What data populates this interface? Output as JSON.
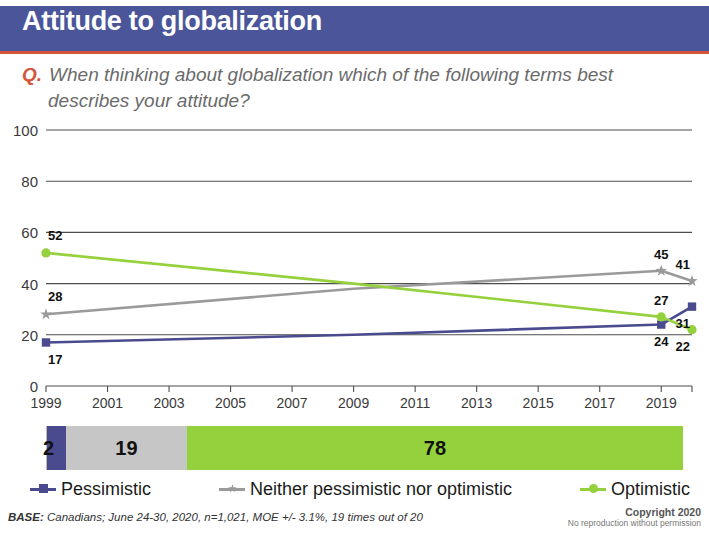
{
  "header": {
    "title": "Attitude to globalization",
    "bar_color": "#4a5699",
    "rule_color": "#d4553b"
  },
  "question": {
    "prefix": "Q.",
    "text": "When thinking about globalization which of the following terms best describes your attitude?"
  },
  "chart_data": {
    "type": "line",
    "title": "Attitude to globalization",
    "xlabel": "",
    "ylabel": "",
    "ylim": [
      0,
      100
    ],
    "yticks": [
      0,
      20,
      40,
      60,
      80,
      100
    ],
    "xlim": [
      1999,
      2020
    ],
    "xticks": [
      1999,
      2001,
      2003,
      2005,
      2007,
      2009,
      2011,
      2013,
      2015,
      2017,
      2019
    ],
    "xtick_labels": [
      "1999",
      "2001",
      "2003",
      "2005",
      "2007",
      "2009",
      "2011",
      "2013",
      "2015",
      "2017",
      "2019"
    ],
    "grid": "horizontal",
    "legend_position": "bottom",
    "series": [
      {
        "name": "Pessimistic",
        "color": "#4a4a8f",
        "marker": "square",
        "x": [
          1999,
          2009,
          2019,
          2020
        ],
        "values": [
          17,
          20,
          24,
          31
        ],
        "labels": [
          {
            "x": 1999,
            "value": 17,
            "text": "17",
            "pos": "below"
          },
          {
            "x": 2019,
            "value": 24,
            "text": "24",
            "pos": "below"
          },
          {
            "x": 2020,
            "value": 31,
            "text": "31",
            "pos": "below"
          }
        ]
      },
      {
        "name": "Neither pessimistic nor optimistic",
        "color": "#9a9a9a",
        "marker": "star",
        "x": [
          1999,
          2009,
          2019,
          2020
        ],
        "values": [
          28,
          38,
          45,
          41
        ],
        "labels": [
          {
            "x": 1999,
            "value": 28,
            "text": "28",
            "pos": "above"
          },
          {
            "x": 2019,
            "value": 45,
            "text": "45",
            "pos": "above"
          },
          {
            "x": 2020,
            "value": 41,
            "text": "41",
            "pos": "above"
          }
        ]
      },
      {
        "name": "Optimistic",
        "color": "#94d13d",
        "marker": "circle",
        "x": [
          1999,
          2009,
          2019,
          2020
        ],
        "values": [
          52,
          40,
          27,
          22
        ],
        "labels": [
          {
            "x": 1999,
            "value": 52,
            "text": "52",
            "pos": "above"
          },
          {
            "x": 2019,
            "value": 27,
            "text": "27",
            "pos": "above"
          },
          {
            "x": 2020,
            "value": 22,
            "text": "22",
            "pos": "below"
          }
        ]
      }
    ]
  },
  "summary_bar": {
    "segments": [
      {
        "name": "Pessimistic",
        "value": 2,
        "label": "2",
        "color": "#4a4a8f",
        "width_pct": 3
      },
      {
        "name": "Neither pessimistic nor optimistic",
        "value": 19,
        "label": "19",
        "color": "#c6c6c6",
        "width_pct": 19
      },
      {
        "name": "Optimistic",
        "value": 78,
        "label": "78",
        "color": "#94d13d",
        "width_pct": 78
      }
    ]
  },
  "legend": {
    "items": [
      {
        "label": "Pessimistic",
        "color": "#4a4a8f",
        "marker": "square"
      },
      {
        "label": "Neither pessimistic nor optimistic",
        "color": "#9a9a9a",
        "marker": "star"
      },
      {
        "label": "Optimistic",
        "color": "#94d13d",
        "marker": "circle"
      }
    ]
  },
  "footer": {
    "base_keyword": "BASE:",
    "base_text": "Canadians; June 24-30, 2020, n=1,021, MOE +/- 3.1%, 19 times out of 20",
    "copyright_line1": "Copyright 2020",
    "copyright_line2": "No reproduction without permission"
  }
}
